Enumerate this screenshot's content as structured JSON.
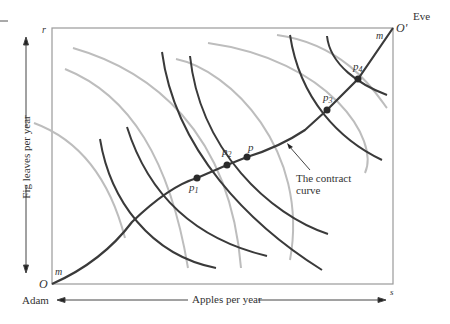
{
  "diagram": {
    "origins": {
      "adam_origin": "O",
      "eve_origin": "O'",
      "adam_label": "Adam",
      "eve_label": "Eve"
    },
    "corners": {
      "top_left": "r",
      "bottom_right": "s"
    },
    "axes": {
      "x_label": "Apples per year",
      "y_label": "Fig leaves per year"
    },
    "curve_endpoint_labels": {
      "start": "m",
      "end": "m"
    },
    "points": [
      {
        "name": "p",
        "sub": "1"
      },
      {
        "name": "p",
        "sub": "2"
      },
      {
        "name": "p",
        "sub": ""
      },
      {
        "name": "p",
        "sub": "3"
      },
      {
        "name": "p",
        "sub": "4"
      }
    ],
    "annotation": {
      "line1": "The contract",
      "line2": "curve"
    },
    "colors": {
      "adam_indifference": "#3a3a3a",
      "eve_indifference": "#bdbdbd",
      "contract_curve": "#3a3a3a",
      "box": "#9a9a9a"
    }
  }
}
